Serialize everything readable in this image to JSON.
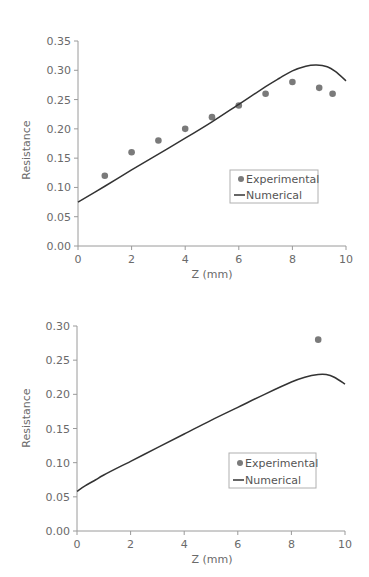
{
  "chart_data": [
    {
      "type": "scatter+line",
      "title": "",
      "xlabel": "Z (mm)",
      "ylabel": "Resistance",
      "xlim": [
        0,
        10
      ],
      "ylim": [
        0,
        0.35
      ],
      "x_ticks": [
        "0",
        "2",
        "4",
        "6",
        "8",
        "10"
      ],
      "y_ticks": [
        "0.00",
        "0.05",
        "0.10",
        "0.15",
        "0.20",
        "0.25",
        "0.30",
        "0.35"
      ],
      "grid": false,
      "legend_position": "center-right",
      "legend": [
        "Experimental",
        "Numerical"
      ],
      "series": [
        {
          "name": "Experimental",
          "type": "scatter",
          "x": [
            1,
            2,
            3,
            4,
            5,
            6,
            7,
            8,
            9,
            9.5
          ],
          "y": [
            0.12,
            0.16,
            0.18,
            0.2,
            0.22,
            0.24,
            0.26,
            0.28,
            0.27,
            0.26
          ]
        },
        {
          "name": "Numerical",
          "type": "line",
          "x": [
            0,
            1,
            2,
            3,
            4,
            5,
            6,
            7,
            7.5,
            8,
            8.5,
            8.9,
            9.3,
            9.6,
            10
          ],
          "y": [
            0.075,
            0.102,
            0.13,
            0.157,
            0.184,
            0.212,
            0.242,
            0.272,
            0.286,
            0.299,
            0.307,
            0.309,
            0.306,
            0.298,
            0.282
          ]
        }
      ]
    },
    {
      "type": "scatter+line",
      "title": "",
      "xlabel": "Z (mm)",
      "ylabel": "Resistance",
      "xlim": [
        0,
        10
      ],
      "ylim": [
        0,
        0.3
      ],
      "x_ticks": [
        "0",
        "2",
        "4",
        "6",
        "8",
        "10"
      ],
      "y_ticks": [
        "0.00",
        "0.05",
        "0.10",
        "0.15",
        "0.20",
        "0.25",
        "0.30"
      ],
      "grid": false,
      "legend_position": "center-right",
      "legend": [
        "Experimental",
        "Numerical"
      ],
      "series": [
        {
          "name": "Experimental",
          "type": "scatter",
          "x": [
            9
          ],
          "y": [
            0.28
          ]
        },
        {
          "name": "Numerical",
          "type": "line",
          "x": [
            0,
            0.3,
            0.7,
            1,
            2,
            3,
            4,
            5,
            6,
            7,
            8,
            8.5,
            9,
            9.3,
            9.6,
            10
          ],
          "y": [
            0.058,
            0.066,
            0.075,
            0.082,
            0.102,
            0.122,
            0.142,
            0.162,
            0.181,
            0.2,
            0.218,
            0.225,
            0.229,
            0.229,
            0.225,
            0.215
          ]
        }
      ]
    }
  ]
}
